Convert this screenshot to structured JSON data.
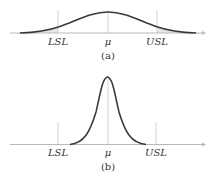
{
  "diagram": {
    "type": "normal-distribution-vs-spec-limits",
    "colors": {
      "curve": "#3a3a3a",
      "axis": "#b8b8b8",
      "guide": "#c8c8c8",
      "tail_fill": "#e6e6e6",
      "text": "#333333"
    },
    "panels": [
      {
        "id": "a",
        "caption": "(a)",
        "labels": {
          "lsl": "LSL",
          "mean": "μ",
          "usl": "USL"
        },
        "description": "Wide distribution; tails extend beyond LSL and USL (shaded)"
      },
      {
        "id": "b",
        "caption": "(b)",
        "labels": {
          "lsl": "LSL",
          "mean": "μ",
          "usl": "USL"
        },
        "description": "Narrow distribution; entirely within LSL and USL"
      }
    ]
  }
}
